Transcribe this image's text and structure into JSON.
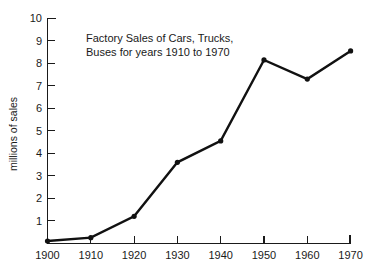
{
  "chart_data": {
    "type": "line",
    "title": "Factory Sales of Cars, Trucks, Buses for years 1910 to 1970",
    "title_lines": [
      "Factory Sales of Cars, Trucks,",
      "Buses for years 1910 to 1970"
    ],
    "subtitle": "",
    "xlabel": "",
    "ylabel": "millions of sales",
    "x": [
      1900,
      1910,
      1920,
      1930,
      1940,
      1950,
      1960,
      1970
    ],
    "values": [
      0.1,
      0.25,
      1.2,
      3.6,
      4.55,
      8.15,
      7.3,
      8.55
    ],
    "categories": [
      "1900",
      "1910",
      "1920",
      "1930",
      "1940",
      "1950",
      "1960",
      "1970"
    ],
    "xlim": [
      1900,
      1970
    ],
    "ylim": [
      0,
      10
    ],
    "xtick_labels": [
      "1900",
      "1910",
      "1920",
      "1930",
      "1940",
      "1950",
      "1960",
      "1970"
    ],
    "ytick_labels": [
      "1",
      "2",
      "3",
      "4",
      "5",
      "6",
      "7",
      "8",
      "9",
      "10"
    ],
    "ytick_values": [
      1,
      2,
      3,
      4,
      5,
      6,
      7,
      8,
      9,
      10
    ],
    "grid": false,
    "legend": false,
    "legend_position": "none",
    "marker": "circle",
    "series": [
      {
        "name": "Factory sales",
        "values": [
          0.1,
          0.25,
          1.2,
          3.6,
          4.55,
          8.15,
          7.3,
          8.55
        ]
      }
    ],
    "colors": {
      "line": "#111111",
      "marker": "#111111",
      "axis": "#1a1a1a",
      "text": "#1a1a1a",
      "background": "#ffffff"
    }
  }
}
